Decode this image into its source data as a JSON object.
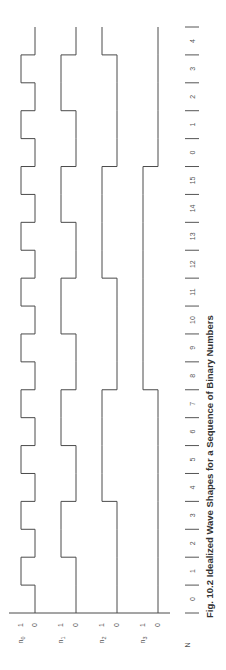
{
  "figure": {
    "caption": "Fig. 10.2  Idealized Wave Shapes for a Sequence of Binary Numbers",
    "axis_label": "N",
    "sequence": [
      0,
      1,
      2,
      3,
      4,
      5,
      6,
      7,
      8,
      9,
      10,
      11,
      12,
      13,
      14,
      15,
      0,
      1,
      2,
      3,
      4
    ],
    "signals": [
      {
        "name": "n",
        "sub": "0",
        "bit": 0,
        "high_label": "1",
        "low_label": "0",
        "x_high": 21,
        "x_low": 35
      },
      {
        "name": "n",
        "sub": "1",
        "bit": 1,
        "high_label": "1",
        "low_label": "0",
        "x_high": 61,
        "x_low": 76
      },
      {
        "name": "n",
        "sub": "2",
        "bit": 2,
        "high_label": "1",
        "low_label": "0",
        "x_high": 102,
        "x_low": 117
      },
      {
        "name": "n",
        "sub": "3",
        "bit": 3,
        "high_label": "1",
        "low_label": "0",
        "x_high": 143,
        "x_low": 158
      }
    ],
    "colors": {
      "line": "#4a4a4a",
      "text": "#555555",
      "title": "#333333",
      "background": "#ffffff"
    }
  },
  "chart_data": {
    "type": "line",
    "title": "Fig. 10.2  Idealized Wave Shapes for a Sequence of Binary Numbers",
    "xlabel": "N",
    "ylabel": "",
    "categories": [
      "0",
      "1",
      "2",
      "3",
      "4",
      "5",
      "6",
      "7",
      "8",
      "9",
      "10",
      "11",
      "12",
      "13",
      "14",
      "15",
      "0",
      "1",
      "2",
      "3",
      "4"
    ],
    "series": [
      {
        "name": "n0",
        "values": [
          0,
          1,
          0,
          1,
          0,
          1,
          0,
          1,
          0,
          1,
          0,
          1,
          0,
          1,
          0,
          1,
          0,
          1,
          0,
          1,
          0
        ]
      },
      {
        "name": "n1",
        "values": [
          0,
          0,
          1,
          1,
          0,
          0,
          1,
          1,
          0,
          0,
          1,
          1,
          0,
          0,
          1,
          1,
          0,
          0,
          1,
          1,
          0
        ]
      },
      {
        "name": "n2",
        "values": [
          0,
          0,
          0,
          0,
          1,
          1,
          1,
          1,
          0,
          0,
          0,
          0,
          1,
          1,
          1,
          1,
          0,
          0,
          0,
          0,
          1
        ]
      },
      {
        "name": "n3",
        "values": [
          0,
          0,
          0,
          0,
          0,
          0,
          0,
          0,
          1,
          1,
          1,
          1,
          1,
          1,
          1,
          1,
          0,
          0,
          0,
          0,
          0
        ]
      }
    ],
    "ylim": [
      0,
      1
    ],
    "grid": false,
    "orientation": "rotated 90 degrees counter-clockwise (N increases upward)"
  }
}
